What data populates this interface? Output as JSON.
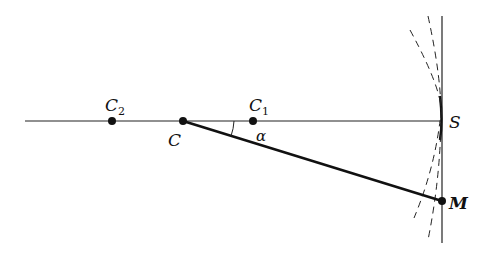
{
  "diagram": {
    "axis": {
      "x1": 25,
      "x2": 442,
      "y": 121
    },
    "vertical_line": {
      "x": 442,
      "y1": 16,
      "y2": 243
    },
    "points": [
      {
        "id": "C2",
        "label": "C",
        "sub": "2",
        "x": 112,
        "y": 121
      },
      {
        "id": "C",
        "label": "C",
        "sub": "",
        "x": 183,
        "y": 121
      },
      {
        "id": "C1",
        "label": "C",
        "sub": "1",
        "x": 253,
        "y": 121
      },
      {
        "id": "S",
        "label": "S",
        "sub": "",
        "x": 442,
        "y": 121
      },
      {
        "id": "M",
        "label": "M",
        "sub": "",
        "x": 442,
        "y": 201
      }
    ],
    "segment_CM": {
      "from": "C",
      "to": "M"
    },
    "angle_label": "α",
    "labels": {
      "C2": "C",
      "C2_sub": "2",
      "C": "C",
      "C1": "C",
      "C1_sub": "1",
      "S": "S",
      "M": "M",
      "alpha": "α"
    }
  }
}
